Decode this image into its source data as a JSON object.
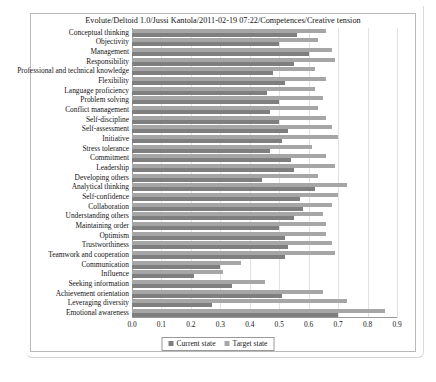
{
  "chart_data": {
    "type": "bar",
    "orientation": "horizontal",
    "title": "Evolute/Deltoid 1.0/Jussi Kantola/2011-02-19 07:22/Competences/Creative tension",
    "xlabel": "",
    "ylabel": "",
    "xlim": [
      0.0,
      0.9
    ],
    "grid": true,
    "legend_position": "bottom",
    "xticks": [
      "0.0",
      "0.1",
      "0.2",
      "0.3",
      "0.4",
      "0.5",
      "0.6",
      "0.7",
      "0.8",
      "0.9"
    ],
    "xtick_values": [
      0.0,
      0.1,
      0.2,
      0.3,
      0.4,
      0.5,
      0.6,
      0.7,
      0.8,
      0.9
    ],
    "categories": [
      "Conceptual thinking",
      "Objectivity",
      "Management",
      "Responsibility",
      "Professional and technical knowledge",
      "Flexibility",
      "Language proficiency",
      "Problem solving",
      "Conflict management",
      "Self-discipline",
      "Self-assessment",
      "Initiative",
      "Stress tolerance",
      "Commitment",
      "Leadership",
      "Developing others",
      "Analytical thinking",
      "Self-confidence",
      "Collaboration",
      "Understanding others",
      "Maintaining order",
      "Optimism",
      "Trustworthiness",
      "Teamwork and cooperation",
      "Communication",
      "Influence",
      "Seeking information",
      "Achievement orientation",
      "Leveraging diversity",
      "Emotional awareness"
    ],
    "series": [
      {
        "name": "Current state",
        "color": "#7f7f7f",
        "values": [
          0.56,
          0.5,
          0.6,
          0.55,
          0.48,
          0.52,
          0.46,
          0.5,
          0.47,
          0.5,
          0.53,
          0.51,
          0.47,
          0.54,
          0.55,
          0.44,
          0.62,
          0.57,
          0.58,
          0.55,
          0.5,
          0.52,
          0.53,
          0.52,
          0.3,
          0.21,
          0.34,
          0.51,
          0.27,
          0.7
        ]
      },
      {
        "name": "Target state",
        "color": "#a6a6a6",
        "values": [
          0.66,
          0.63,
          0.68,
          0.69,
          0.62,
          0.66,
          0.62,
          0.65,
          0.63,
          0.66,
          0.68,
          0.7,
          0.61,
          0.66,
          0.69,
          0.63,
          0.73,
          0.7,
          0.68,
          0.65,
          0.66,
          0.66,
          0.68,
          0.69,
          0.37,
          0.31,
          0.45,
          0.65,
          0.73,
          0.86
        ]
      }
    ]
  },
  "legend": {
    "current_label": "Current state",
    "target_label": "Target state"
  }
}
